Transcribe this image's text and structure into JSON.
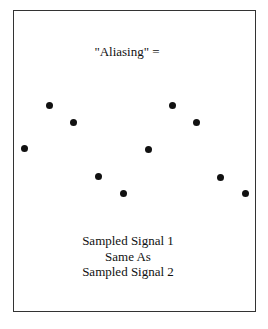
{
  "title": "\"Aliasing\" =",
  "caption": [
    "Sampled Signal 1",
    "Same As",
    "Sampled Signal 2"
  ],
  "dots": [
    {
      "x": 24,
      "y": 148
    },
    {
      "x": 49,
      "y": 105
    },
    {
      "x": 73,
      "y": 122
    },
    {
      "x": 98,
      "y": 176
    },
    {
      "x": 123,
      "y": 193
    },
    {
      "x": 148,
      "y": 149
    },
    {
      "x": 172,
      "y": 105
    },
    {
      "x": 196,
      "y": 122
    },
    {
      "x": 220,
      "y": 177
    },
    {
      "x": 245,
      "y": 193
    }
  ]
}
